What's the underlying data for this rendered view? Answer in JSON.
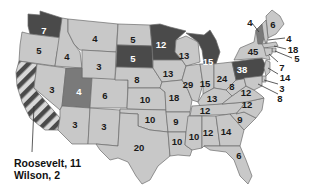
{
  "colors": {
    "wilson": "#c8c8c8",
    "roosevelt": "#4a4a4a",
    "taft": "#7a7a7a",
    "split_stripe_a": "#4a4a4a",
    "split_stripe_b": "#d8d8d8",
    "border": "#6b6b6b"
  },
  "annotation": {
    "line1": "Roosevelt, 11",
    "line2": "Wilson, 2"
  },
  "states": [
    {
      "id": "WA",
      "votes": "7",
      "party": "roosevelt"
    },
    {
      "id": "OR",
      "votes": "5",
      "party": "wilson"
    },
    {
      "id": "CA",
      "votes": "",
      "party": "split"
    },
    {
      "id": "ID",
      "votes": "4",
      "party": "wilson"
    },
    {
      "id": "NV",
      "votes": "3",
      "party": "wilson"
    },
    {
      "id": "MT",
      "votes": "4",
      "party": "wilson"
    },
    {
      "id": "WY",
      "votes": "3",
      "party": "wilson"
    },
    {
      "id": "UT",
      "votes": "4",
      "party": "taft"
    },
    {
      "id": "CO",
      "votes": "6",
      "party": "wilson"
    },
    {
      "id": "AZ",
      "votes": "3",
      "party": "wilson"
    },
    {
      "id": "NM",
      "votes": "3",
      "party": "wilson"
    },
    {
      "id": "ND",
      "votes": "5",
      "party": "wilson"
    },
    {
      "id": "SD",
      "votes": "5",
      "party": "roosevelt"
    },
    {
      "id": "NE",
      "votes": "8",
      "party": "wilson"
    },
    {
      "id": "KS",
      "votes": "10",
      "party": "wilson"
    },
    {
      "id": "OK",
      "votes": "10",
      "party": "wilson"
    },
    {
      "id": "TX",
      "votes": "20",
      "party": "wilson"
    },
    {
      "id": "MN",
      "votes": "12",
      "party": "roosevelt"
    },
    {
      "id": "IA",
      "votes": "13",
      "party": "wilson"
    },
    {
      "id": "MO",
      "votes": "18",
      "party": "wilson"
    },
    {
      "id": "AR",
      "votes": "9",
      "party": "wilson"
    },
    {
      "id": "LA",
      "votes": "10",
      "party": "wilson"
    },
    {
      "id": "WI",
      "votes": "13",
      "party": "wilson"
    },
    {
      "id": "IL",
      "votes": "29",
      "party": "wilson"
    },
    {
      "id": "MI",
      "votes": "15",
      "party": "roosevelt"
    },
    {
      "id": "IN",
      "votes": "15",
      "party": "wilson"
    },
    {
      "id": "OH",
      "votes": "24",
      "party": "wilson"
    },
    {
      "id": "KY",
      "votes": "13",
      "party": "wilson"
    },
    {
      "id": "TN",
      "votes": "12",
      "party": "wilson"
    },
    {
      "id": "MS",
      "votes": "10",
      "party": "wilson"
    },
    {
      "id": "AL",
      "votes": "12",
      "party": "wilson"
    },
    {
      "id": "GA",
      "votes": "14",
      "party": "wilson"
    },
    {
      "id": "FL",
      "votes": "6",
      "party": "wilson"
    },
    {
      "id": "SC",
      "votes": "9",
      "party": "wilson"
    },
    {
      "id": "NC",
      "votes": "12",
      "party": "wilson"
    },
    {
      "id": "VA",
      "votes": "12",
      "party": "wilson"
    },
    {
      "id": "WV",
      "votes": "8",
      "party": "wilson"
    },
    {
      "id": "PA",
      "votes": "38",
      "party": "roosevelt"
    },
    {
      "id": "NY",
      "votes": "45",
      "party": "wilson"
    },
    {
      "id": "VT",
      "votes": "4",
      "party": "taft"
    },
    {
      "id": "ME",
      "votes": "6",
      "party": "wilson"
    },
    {
      "id": "NH",
      "votes": "4",
      "party": "wilson"
    },
    {
      "id": "MA",
      "votes": "18",
      "party": "wilson"
    },
    {
      "id": "RI",
      "votes": "5",
      "party": "wilson"
    },
    {
      "id": "CT",
      "votes": "7",
      "party": "wilson"
    },
    {
      "id": "NJ",
      "votes": "14",
      "party": "wilson"
    },
    {
      "id": "DE",
      "votes": "3",
      "party": "wilson"
    },
    {
      "id": "MD",
      "votes": "8",
      "party": "wilson"
    }
  ],
  "labels": {
    "WA": "7",
    "OR": "5",
    "ID": "4",
    "NV": "3",
    "MT": "4",
    "WY": "3",
    "UT": "4",
    "CO": "6",
    "AZ": "3",
    "NM": "3",
    "ND": "5",
    "SD": "5",
    "NE": "8",
    "KS": "10",
    "OK": "10",
    "TX": "20",
    "MN": "12",
    "IA": "13",
    "MO": "18",
    "AR": "9",
    "LA": "10",
    "WI": "13",
    "IL": "29",
    "MI": "15",
    "IN": "15",
    "OH": "24",
    "KY": "13",
    "TN": "12",
    "MS": "10",
    "AL": "12",
    "GA": "14",
    "FL": "6",
    "SC": "9",
    "NC": "12",
    "VA": "12",
    "WV": "8",
    "PA": "38",
    "NY": "45",
    "VT": "4",
    "ME": "6",
    "NH": "4",
    "MA": "18",
    "RI": "5",
    "CT": "7",
    "NJ": "14",
    "DE": "3",
    "MD": "8"
  }
}
